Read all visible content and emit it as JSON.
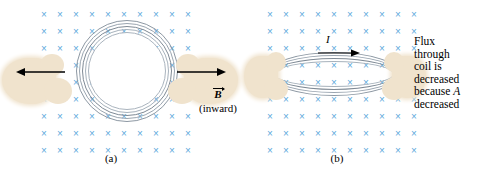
{
  "figure": {
    "type": "physics-diagram",
    "topic": "Electromagnetic induction: changing flux by changing coil area",
    "background_color": "#ffffff",
    "field_mark_color": "#5da9dc",
    "coil_color": "#8d98a3",
    "hand_color": "#f0e3cd",
    "arrow_color": "#000000"
  },
  "field": {
    "mark_glyph": "×",
    "direction_label": "inward",
    "columns": 10,
    "rows": 9
  },
  "panel_a": {
    "label": "(a)",
    "coil_shape": "circle",
    "turns": 4,
    "arrow_left_name": "pull-left-arrow",
    "arrow_right_name": "pull-right-arrow"
  },
  "panel_b": {
    "label": "(b)",
    "coil_shape": "flattened-ellipse",
    "turns": 4,
    "current_label": "I",
    "current_direction": "right"
  },
  "labels": {
    "b_field_symbol": "B",
    "b_field_parenthetical": "(inward)"
  },
  "caption": {
    "line1": "Flux",
    "line2": "through",
    "line3": "coil is",
    "line4": "decreased",
    "line5_prefix": "because ",
    "line5_italic": "A",
    "line6": "decreased"
  }
}
